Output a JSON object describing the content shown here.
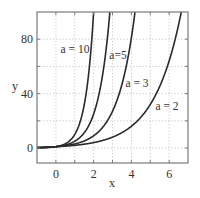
{
  "chart_data": {
    "type": "line",
    "title": "",
    "xlabel": "x",
    "ylabel": "y",
    "xlim": [
      -1,
      7
    ],
    "ylim": [
      -11,
      100
    ],
    "grid": true,
    "legend": "inline annotations",
    "x_ticks": [
      0,
      2,
      4,
      6
    ],
    "y_ticks": [
      0,
      40,
      80
    ],
    "x_tick_labels": [
      "0",
      "2",
      "4",
      "6"
    ],
    "y_tick_labels": [
      "0",
      "40",
      "80"
    ],
    "function": "y = a^x",
    "series": [
      {
        "name": "a = 10",
        "a": 10,
        "label": "a = 10",
        "x": [
          -1,
          0,
          0.5,
          1,
          1.5,
          2
        ],
        "values": [
          0.1,
          1,
          3.16,
          10,
          31.6,
          100
        ]
      },
      {
        "name": "a=5",
        "a": 5,
        "label": "a=5",
        "x": [
          -1,
          0,
          1,
          2,
          2.5,
          2.86
        ],
        "values": [
          0.2,
          1,
          5,
          25,
          55.9,
          100
        ]
      },
      {
        "name": "a = 3",
        "a": 3,
        "label": "a = 3",
        "x": [
          -1,
          0,
          1,
          2,
          3,
          4,
          4.19
        ],
        "values": [
          0.33,
          1,
          3,
          9,
          27,
          81,
          100
        ]
      },
      {
        "name": "a = 2",
        "a": 2,
        "label": "a = 2",
        "x": [
          -1,
          0,
          1,
          2,
          3,
          4,
          5,
          6,
          6.64
        ],
        "values": [
          0.5,
          1,
          2,
          4,
          8,
          16,
          32,
          64,
          100
        ]
      }
    ],
    "colors": {
      "curve": "#2a2a2a",
      "frame": "#7a7a7a",
      "grid": "#bdbdbd",
      "text": "#333333"
    }
  }
}
